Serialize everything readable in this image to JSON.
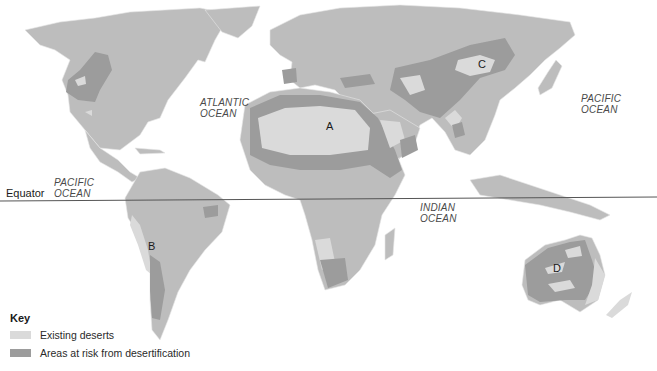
{
  "map": {
    "type": "world desertification map",
    "colors": {
      "background": "#ffffff",
      "land": "#bdbdbd",
      "existing_deserts": "#dadada",
      "at_risk": "#9c9c9c",
      "equator_line": "#555555"
    },
    "ocean_labels": [
      {
        "line1": "ATLANTIC",
        "line2": "OCEAN"
      },
      {
        "line1": "PACIFIC",
        "line2": "OCEAN"
      },
      {
        "line1": "PACIFIC",
        "line2": "OCEAN"
      },
      {
        "line1": "INDIAN",
        "line2": "OCEAN"
      }
    ],
    "point_labels": [
      "A",
      "B",
      "C",
      "D"
    ],
    "equator_label": "Equator"
  },
  "key": {
    "title": "Key",
    "items": [
      {
        "label": "Existing deserts",
        "color": "#dadada"
      },
      {
        "label": "Areas at risk from desertification",
        "color": "#9c9c9c"
      }
    ]
  }
}
